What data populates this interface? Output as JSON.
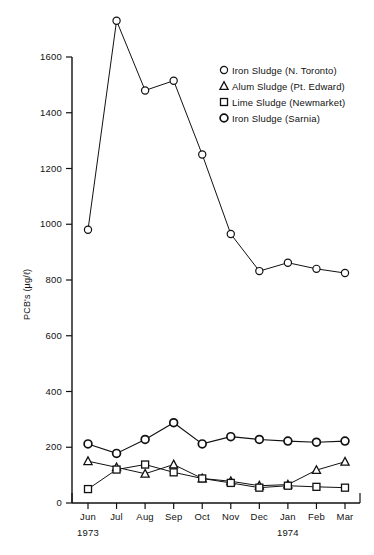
{
  "chart_data": {
    "type": "line",
    "title": "",
    "xlabel": "",
    "ylabel": "PCB's (µg/ℓ)",
    "categories": [
      "Jun",
      "Jul",
      "Aug",
      "Sep",
      "Oct",
      "Nov",
      "Dec",
      "Jan",
      "Feb",
      "Mar"
    ],
    "year_labels": [
      {
        "text": "1973",
        "under_category": "Jun"
      },
      {
        "text": "1974",
        "under_category": "Jan"
      }
    ],
    "ylim": [
      0,
      1600
    ],
    "yticks": [
      0,
      200,
      400,
      600,
      800,
      1000,
      1200,
      1400,
      1600
    ],
    "grid": false,
    "legend_position": "upper-right",
    "series": [
      {
        "name": "Iron Sludge (N. Toronto)",
        "marker": "circle",
        "values": [
          980,
          1730,
          1480,
          1515,
          1250,
          965,
          832,
          862,
          840,
          825
        ]
      },
      {
        "name": "Alum Sludge (Pt. Edward)",
        "marker": "triangle",
        "values": [
          150,
          128,
          105,
          138,
          88,
          78,
          62,
          66,
          118,
          148
        ]
      },
      {
        "name": "Lime Sludge (Newmarket)",
        "marker": "square",
        "values": [
          50,
          120,
          138,
          110,
          88,
          72,
          55,
          62,
          58,
          55
        ]
      },
      {
        "name": "Iron Sludge (Sarnia)",
        "marker": "circle-bold",
        "values": [
          212,
          178,
          228,
          288,
          212,
          238,
          228,
          222,
          218,
          222
        ]
      }
    ]
  },
  "legend": {
    "items": [
      {
        "marker": "circle",
        "label": "Iron Sludge (N. Toronto)"
      },
      {
        "marker": "triangle",
        "label": "Alum Sludge (Pt. Edward)"
      },
      {
        "marker": "square",
        "label": "Lime Sludge (Newmarket)"
      },
      {
        "marker": "circle-bold",
        "label": "Iron Sludge (Sarnia)"
      }
    ]
  }
}
